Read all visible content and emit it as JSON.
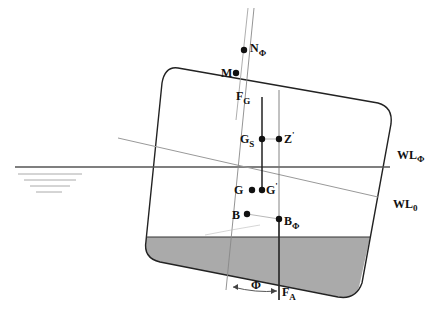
{
  "diagram": {
    "colors": {
      "hull_stroke": "#222222",
      "water_fill": "#aaaaaa",
      "waterline": "#555555",
      "thin_line": "#888888",
      "point": "#111111",
      "text": "#111111"
    },
    "labels": {
      "N_phi": {
        "main": "N",
        "sub": "Φ"
      },
      "M": {
        "main": "M",
        "sub": ""
      },
      "F_G": {
        "main": "F",
        "sub": "G"
      },
      "G_S": {
        "main": "G",
        "sub": "S"
      },
      "Z_prime": {
        "main": "Z",
        "sub": "'"
      },
      "G": {
        "main": "G",
        "sub": ""
      },
      "G_prime": {
        "main": "G",
        "sub": "'"
      },
      "B": {
        "main": "B",
        "sub": ""
      },
      "B_phi": {
        "main": "B",
        "sub": "Φ"
      },
      "F_A": {
        "main": "F",
        "sub": "A"
      },
      "phi_angle": {
        "main": "Φ",
        "sub": ""
      },
      "WL_phi": {
        "main": "WL",
        "sub": "Φ"
      },
      "WL_0": {
        "main": "WL",
        "sub": "0"
      }
    },
    "points": {
      "N_phi": [
        244,
        50
      ],
      "M": [
        236,
        73
      ],
      "G_S": [
        262,
        139
      ],
      "Z_prime": [
        279,
        139
      ],
      "G": [
        252,
        190
      ],
      "G_prime": [
        262,
        190
      ],
      "B": [
        247,
        214
      ],
      "B_phi": [
        279,
        219
      ]
    }
  }
}
